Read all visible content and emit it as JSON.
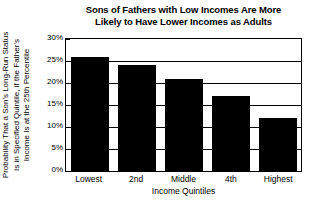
{
  "chart_data": {
    "type": "bar",
    "title": "Sons of Fathers with Low Incomes Are More Likely to Have Lower Incomes as Adults",
    "title_lines": [
      "Sons of Fathers with Low Incomes Are More",
      "Likely to Have Lower Incomes as Adults"
    ],
    "categories": [
      "Lowest",
      "2nd",
      "Middle",
      "4th",
      "Highest"
    ],
    "values": [
      26,
      24,
      21,
      17,
      12
    ],
    "xlabel": "Income Quintiles",
    "ylabel": "Probability That a Son's Long-Run Status Is in Specified Quintile, if the Father's Income Is at the 25th Percentile",
    "ylabel_lines": [
      "Probability That a Son's Long-Run Status",
      "Is in Specified Quintile, if the Father's",
      "Income Is at the 25th Percentile"
    ],
    "ylim": [
      0,
      30
    ],
    "ytick_values": [
      30,
      25,
      20,
      15,
      10,
      5,
      0
    ],
    "ytick_labels": [
      "30%",
      "25%",
      "20%",
      "15%",
      "10%",
      "5%",
      "0%"
    ],
    "grid": true,
    "legend": false,
    "bar_color": "#000000",
    "background_color": "#ffffff"
  }
}
